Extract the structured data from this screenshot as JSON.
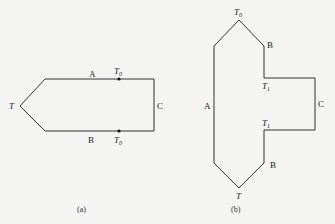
{
  "figure_a": {
    "caption": "(a)",
    "labels": {
      "left_vertex": "T",
      "top_edge": "A",
      "bottom_edge": "B",
      "right_edge": "C",
      "top_dot": "T",
      "top_dot_sub": "0",
      "bottom_dot": "T",
      "bottom_dot_sub": "0"
    }
  },
  "figure_b": {
    "caption": "(b)",
    "labels": {
      "top_vertex": "T",
      "top_vertex_sub": "0",
      "upper_right": "B",
      "left_edge": "A",
      "upper_notch": "T",
      "upper_notch_sub": "1",
      "right_edge": "C",
      "lower_notch": "T",
      "lower_notch_sub": "1",
      "lower_right": "B",
      "bottom_vertex": "T"
    }
  },
  "colors": {
    "line": "#333333",
    "background": "#f4f4f2"
  }
}
